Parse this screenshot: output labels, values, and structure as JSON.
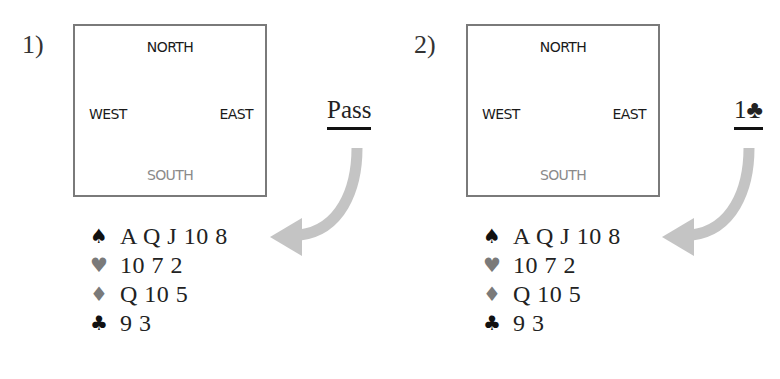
{
  "panels": [
    {
      "number": "1)",
      "table": {
        "north": "NORTH",
        "west": "WEST",
        "east": "EAST",
        "south": "SOUTH"
      },
      "bid": "Pass",
      "hand": [
        {
          "suit": "spades",
          "symbol": "♠",
          "cards": "A Q J 10 8"
        },
        {
          "suit": "hearts",
          "symbol": "♥",
          "cards": "10 7 2"
        },
        {
          "suit": "diamonds",
          "symbol": "♦",
          "cards": "Q 10 5"
        },
        {
          "suit": "clubs",
          "symbol": "♣",
          "cards": "9 3"
        }
      ]
    },
    {
      "number": "2)",
      "table": {
        "north": "NORTH",
        "west": "WEST",
        "east": "EAST",
        "south": "SOUTH"
      },
      "bid": "1♣",
      "hand": [
        {
          "suit": "spades",
          "symbol": "♠",
          "cards": "A Q J 10 8"
        },
        {
          "suit": "hearts",
          "symbol": "♥",
          "cards": "10 7 2"
        },
        {
          "suit": "diamonds",
          "symbol": "♦",
          "cards": "Q 10 5"
        },
        {
          "suit": "clubs",
          "symbol": "♣",
          "cards": "9 3"
        }
      ]
    }
  ],
  "colors": {
    "black_suit": "#111111",
    "red_suit_gray": "#7a7a7a",
    "arrow": "#c4c4c4",
    "box_border": "#7a7a7a",
    "south_label": "#8a8a8a"
  }
}
